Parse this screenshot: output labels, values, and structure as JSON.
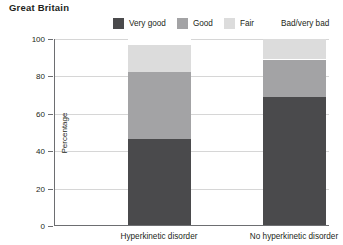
{
  "chart_data": {
    "type": "bar",
    "subtype": "stacked-column-100",
    "title": "Great Britain",
    "xlabel": "",
    "ylabel": "Percentage",
    "ylim": [
      0,
      100
    ],
    "yticks": [
      0,
      20,
      40,
      60,
      80,
      100
    ],
    "grid": true,
    "legend_position": "top-right",
    "categories": [
      "Hyperkinetic disorder",
      "No hyperkinetic disorder"
    ],
    "series": [
      {
        "name": "Very good",
        "color": "#4a4a4c",
        "values": [
          46.0,
          68.5
        ]
      },
      {
        "name": "Good",
        "color": "#a3a3a5",
        "values": [
          36.0,
          20.0
        ]
      },
      {
        "name": "Fair",
        "color": "#dcdcdc",
        "values": [
          14.0,
          11.0
        ]
      },
      {
        "name": "Bad/very bad",
        "color": "#ffffff",
        "values": [
          4.0,
          0.5
        ]
      }
    ]
  },
  "axis": {
    "ytick_labels": [
      "0",
      "20",
      "40",
      "60",
      "80",
      "100"
    ],
    "ylabel": "Percentage"
  },
  "legend": {
    "items": [
      {
        "label": "Very good",
        "color": "#4a4a4c"
      },
      {
        "label": "Good",
        "color": "#a3a3a5"
      },
      {
        "label": "Fair",
        "color": "#dcdcdc"
      },
      {
        "label": "Bad/very bad",
        "color": "#ffffff"
      }
    ]
  },
  "header": {
    "title": "Great Britain"
  }
}
